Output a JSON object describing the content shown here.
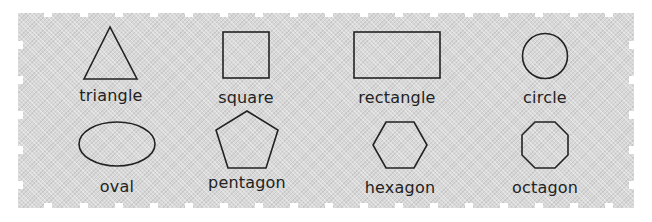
{
  "title": "",
  "stroke_color": "#222222",
  "panel_color": "#d8d8d8",
  "rows": [
    {
      "shapes": [
        {
          "name": "triangle",
          "label": "triangle"
        },
        {
          "name": "square",
          "label": "square"
        },
        {
          "name": "rectangle",
          "label": "rectangle"
        },
        {
          "name": "circle",
          "label": "circle"
        }
      ]
    },
    {
      "shapes": [
        {
          "name": "oval",
          "label": "oval"
        },
        {
          "name": "pentagon",
          "label": "pentagon"
        },
        {
          "name": "hexagon",
          "label": "hexagon"
        },
        {
          "name": "octagon",
          "label": "octagon"
        }
      ]
    }
  ]
}
